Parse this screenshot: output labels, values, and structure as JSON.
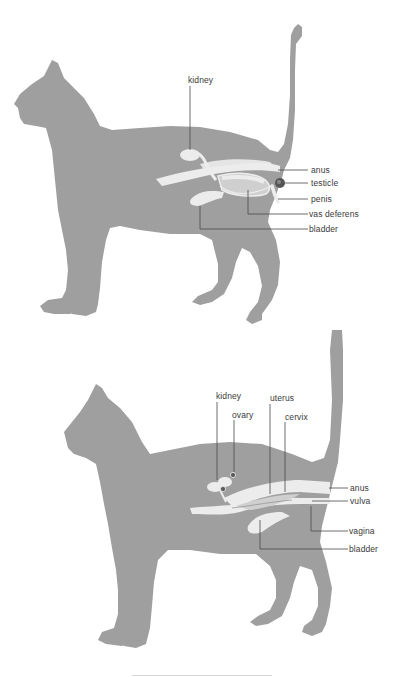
{
  "colors": {
    "silhouette": "#9f9f9f",
    "organ_fill": "#ececec",
    "organ_shade": "#cfcfcf",
    "leader_line": "#4a4a4a",
    "testicle": "#555555",
    "label_text": "#3a3a3a"
  },
  "male": {
    "title": "Male cat reproductive system",
    "labels": {
      "kidney": "kidney",
      "anus": "anus",
      "testicle": "testicle",
      "penis": "penis",
      "vas_deferens": "vas deferens",
      "bladder": "bladder"
    }
  },
  "female": {
    "title": "Female cat reproductive system",
    "labels": {
      "kidney": "kidney",
      "ovary": "ovary",
      "uterus": "uterus",
      "cervix": "cervix",
      "anus": "anus",
      "vulva": "vulva",
      "vagina": "vagina",
      "bladder": "bladder"
    }
  }
}
